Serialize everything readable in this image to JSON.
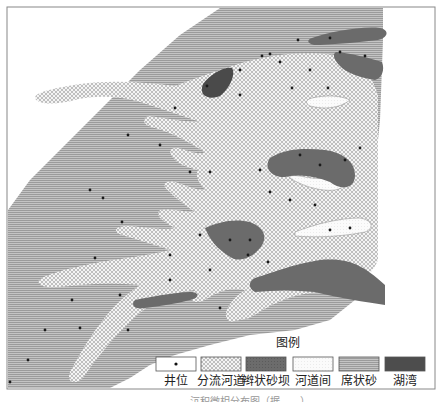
{
  "figure": {
    "frame": {
      "x": 7,
      "y": 7,
      "width": 428,
      "height": 382,
      "stroke": "#888888"
    },
    "caption_partial": "……沉积微相分布图（据……）"
  },
  "legend": {
    "title": "图例",
    "items": [
      {
        "key": "well",
        "label": "井位",
        "pattern": "white-with-dot",
        "color": "#ffffff"
      },
      {
        "key": "distributary_channel",
        "label": "分流河道",
        "pattern": "crosshatch-light",
        "color": "#d9d9d9"
      },
      {
        "key": "braided_bar",
        "label": "辫状砂坝",
        "pattern": "dense-dark",
        "color": "#666666"
      },
      {
        "key": "interchannel",
        "label": "河道间",
        "pattern": "fine-dots",
        "color": "#f2f2f2"
      },
      {
        "key": "sheet_sand",
        "label": "席状砂",
        "pattern": "wave-hatch",
        "color": "#a8a8a8"
      },
      {
        "key": "bay",
        "label": "湖湾",
        "pattern": "solid-dark",
        "color": "#4d4d4d"
      }
    ]
  },
  "colors": {
    "sheet_sand_bg": "#b5b5b5",
    "channel_bg": "#e6e6e6",
    "bar_fill": "#6a6a6a",
    "bay_fill": "#4a4a4a",
    "interchannel_fill": "#f7f7f7",
    "well_dot": "#1a1a1a"
  }
}
